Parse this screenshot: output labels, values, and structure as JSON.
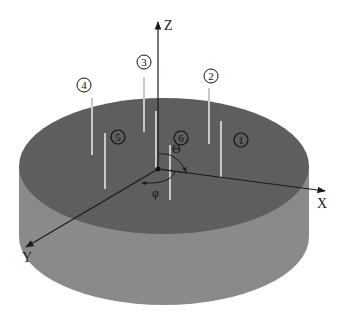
{
  "diagram": {
    "colors": {
      "background": "#ffffff",
      "cylinder_top": "#5e5e5e",
      "cylinder_side": "#8c8c8c",
      "rod": "#c8c8c8",
      "axis": "#1a1a1a",
      "label_circle_stroke": "#111111"
    },
    "axes": {
      "z_label": "Z",
      "x_label": "X",
      "y_label": "Y"
    },
    "angles": {
      "theta_label": "Θ",
      "phi_label": "φ"
    },
    "markers": [
      {
        "id": "1",
        "label": "1"
      },
      {
        "id": "2",
        "label": "2"
      },
      {
        "id": "3",
        "label": "3"
      },
      {
        "id": "4",
        "label": "4"
      },
      {
        "id": "5",
        "label": "5"
      },
      {
        "id": "6",
        "label": "6"
      }
    ]
  }
}
